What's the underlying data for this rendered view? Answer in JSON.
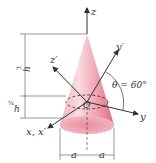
{
  "figure": {
    "axes": {
      "z": "z",
      "y": "y",
      "x": "x, x′",
      "y_prime": "y′",
      "z_prime": "z′",
      "origin": "O"
    },
    "angle": {
      "label": "θ = 60°",
      "value_deg": 60
    },
    "dimensions": {
      "upper_height": {
        "num": "3",
        "den": "4",
        "var": "h"
      },
      "lower_height": {
        "num": "1",
        "den": "4",
        "var": "h"
      },
      "left_radius": "a",
      "right_radius": "a"
    },
    "colors": {
      "cone_light": "#f7d0d6",
      "cone_mid": "#ee9aa8",
      "cone_dark": "#d9607a",
      "line": "#333333"
    }
  }
}
